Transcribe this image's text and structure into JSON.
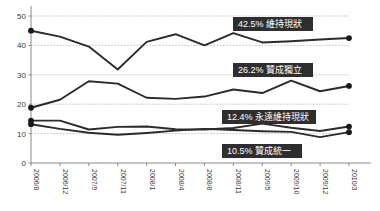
{
  "chart_data": {
    "type": "line",
    "title": "",
    "subtitle": "",
    "xlabel": "",
    "ylabel": "",
    "ylim": [
      0,
      50
    ],
    "yticks": [
      0,
      10,
      20,
      30,
      40,
      50
    ],
    "grid": true,
    "legend_position": "inline-right-end-labels",
    "categories": [
      "2006/8",
      "2006/12",
      "2007/9",
      "2007/11",
      "2008/1",
      "2008/4",
      "2008/8",
      "2008/11",
      "2009/5",
      "2009/10",
      "2009/12",
      "2010/3"
    ],
    "series": [
      {
        "name": "維持現狀",
        "end_value": 42.5,
        "end_label": "42.5% 維持現狀",
        "color": "#2b2b2b",
        "values": [
          45.0,
          43.0,
          39.6,
          31.8,
          41.2,
          43.8,
          40.0,
          44.2,
          41.0,
          41.4,
          42.0,
          42.5
        ]
      },
      {
        "name": "贊成獨立",
        "end_value": 26.2,
        "end_label": "26.2% 贊成獨立",
        "color": "#2b2b2b",
        "values": [
          18.8,
          21.5,
          27.8,
          27.0,
          22.2,
          21.8,
          22.6,
          25.0,
          23.8,
          28.0,
          24.4,
          26.2
        ]
      },
      {
        "name": "永遠維持現狀",
        "end_value": 12.4,
        "end_label": "12.4% 永遠維持現狀",
        "color": "#2b2b2b",
        "values": [
          14.4,
          14.4,
          11.4,
          12.3,
          12.4,
          11.5,
          11.4,
          11.9,
          13.4,
          12.0,
          10.9,
          12.4
        ]
      },
      {
        "name": "贊成統一",
        "end_value": 10.5,
        "end_label": "10.5% 贊成統一",
        "color": "#2b2b2b",
        "values": [
          13.2,
          11.6,
          10.3,
          9.6,
          10.2,
          11.0,
          11.6,
          11.2,
          10.8,
          10.6,
          8.8,
          10.5
        ]
      }
    ],
    "colors": {
      "line": "#2b2b2b",
      "marker": "#1a1a1a",
      "gridline": "#b9b9b9",
      "axis": "#8a8a8a",
      "callout_bg": "#2e2e2e",
      "callout_text": "#ffffff",
      "background": "#ffffff"
    },
    "callouts": [
      {
        "text": "42.5% 維持現狀",
        "series": "維持現狀"
      },
      {
        "text": "26.2% 贊成獨立",
        "series": "贊成獨立"
      },
      {
        "text": "12.4% 永遠維持現狀",
        "series": "永遠維持現狀"
      },
      {
        "text": "10.5% 贊成統一",
        "series": "贊成統一"
      }
    ]
  }
}
